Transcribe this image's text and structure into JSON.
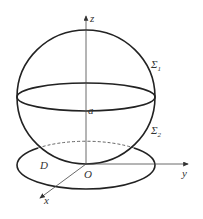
{
  "diagram": {
    "labels": {
      "z_axis": "z",
      "y_axis": "y",
      "x_axis": "x",
      "origin": "O",
      "radius": "a",
      "upper_surface": "Σ",
      "upper_surface_sub": "1",
      "lower_surface": "Σ",
      "lower_surface_sub": "2",
      "region": "D"
    },
    "colors": {
      "stroke": "#222222",
      "axis": "#555555",
      "text": "#333333"
    }
  }
}
